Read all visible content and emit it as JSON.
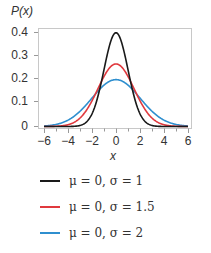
{
  "chart_data": {
    "type": "line",
    "title": "",
    "xlabel": "x",
    "ylabel": "P(x)",
    "xlim": [
      -6.3,
      6.3
    ],
    "ylim": [
      0,
      0.42
    ],
    "x_ticks": [
      "−6",
      "−4",
      "−2",
      "0",
      "2",
      "4",
      "6"
    ],
    "y_ticks": [
      "0",
      "0.1",
      "0.2",
      "0.3",
      "0.4"
    ],
    "grid": false,
    "legend_position": "below",
    "series": [
      {
        "name": "μ = 0, σ = 1",
        "mu": 0,
        "sigma": 1,
        "color": "#1a1a1a",
        "peak": 0.399
      },
      {
        "name": "μ = 0, σ = 1.5",
        "mu": 0,
        "sigma": 1.5,
        "color": "#e0393e",
        "peak": 0.266
      },
      {
        "name": "μ = 0, σ = 2",
        "mu": 0,
        "sigma": 2,
        "color": "#2f8fcf",
        "peak": 0.199
      }
    ]
  },
  "labels": {
    "ylabel": "P(x)",
    "xlabel": "x",
    "yticks": [
      "0.4",
      "0.3",
      "0.2",
      "0.1",
      "0"
    ],
    "xticks": [
      "−6",
      "−4",
      "−2",
      "0",
      "2",
      "4",
      "6"
    ]
  },
  "legend": [
    {
      "text": "μ = 0, σ = 1",
      "color": "#1a1a1a"
    },
    {
      "text": "μ = 0, σ = 1.5",
      "color": "#e0393e"
    },
    {
      "text": "μ = 0, σ = 2",
      "color": "#2f8fcf"
    }
  ]
}
